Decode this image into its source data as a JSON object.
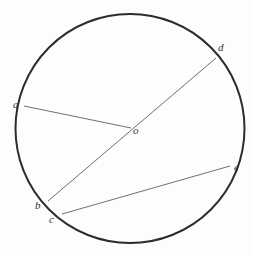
{
  "figure": {
    "background_color": "#fdfdfd",
    "width": 253,
    "height": 255
  },
  "style": {
    "circle_stroke": "#2b2b31",
    "circle_stroke_width": 2,
    "chord_stroke": "#6e6e76",
    "chord_stroke_width": 1,
    "label_color": "#303036",
    "label_font_size": 11
  },
  "geometry": {
    "circle": {
      "name": "circle",
      "cx": 130,
      "cy": 128.5,
      "r": 114.5
    },
    "points": [
      {
        "id": "a",
        "label": "a",
        "x": 24,
        "y": 106,
        "on_circle": true,
        "label_x": 13,
        "label_y": 99
      },
      {
        "id": "b",
        "label": "b",
        "x": 48,
        "y": 201,
        "on_circle": true,
        "label_x": 35,
        "label_y": 200
      },
      {
        "id": "c",
        "label": "c",
        "x": 62,
        "y": 214,
        "on_circle": true,
        "label_x": 49,
        "label_y": 214
      },
      {
        "id": "d",
        "label": "d",
        "x": 216,
        "y": 58,
        "on_circle": true,
        "label_x": 218,
        "label_y": 42
      },
      {
        "id": "e",
        "label": "e",
        "x": 230,
        "y": 166,
        "on_circle": true,
        "label_x": 234,
        "label_y": 162
      },
      {
        "id": "o",
        "label": "o",
        "x": 131,
        "y": 128,
        "on_circle": false,
        "label_x": 133,
        "label_y": 125
      }
    ],
    "segments": [
      {
        "id": "ao",
        "from": "a",
        "to": "o",
        "x1": 24,
        "y1": 106,
        "x2": 131,
        "y2": 128,
        "kind": "radius"
      },
      {
        "id": "bd",
        "from": "b",
        "to": "d",
        "x1": 48,
        "y1": 201,
        "x2": 216,
        "y2": 58,
        "kind": "diameter"
      },
      {
        "id": "ce",
        "from": "c",
        "to": "e",
        "x1": 62,
        "y1": 214,
        "x2": 230,
        "y2": 166,
        "kind": "chord"
      }
    ]
  }
}
